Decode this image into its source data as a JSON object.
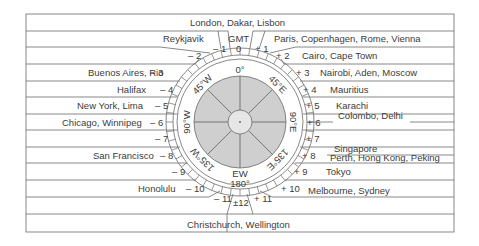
{
  "dial": {
    "gmt_label": "GMT",
    "bearing_labels": {
      "n": "0°",
      "ne": "45°E",
      "e": "90°E",
      "se": "135°E",
      "s": "180°",
      "sw": "135°W",
      "w": "90°W",
      "nw": "45°W",
      "dateline": "EW"
    }
  },
  "offsets": {
    "zero": "0",
    "m1": "– 1",
    "m2": "– 2",
    "m3": "– 3",
    "m4": "– 4",
    "m5": "– 5",
    "m6": "– 6",
    "m7": "– 7",
    "m8": "– 8",
    "m9": "– 9",
    "m10": "– 10",
    "m11": "– 11",
    "p1": "+ 1",
    "p2": "+ 2",
    "p3": "+ 3",
    "p4": "+ 4",
    "p5": "+ 5",
    "p6": "+ 6",
    "p7": "+ 7",
    "p8": "+ 8",
    "p9": "+ 9",
    "p10": "+ 10",
    "p11": "+ 11",
    "pm12": "±12"
  },
  "cities": {
    "gmt0": "London, Dakar, Lisbon",
    "m1": "Reykjavik",
    "m3": "Buenos Aires, Rio",
    "m4": "Halifax",
    "m5": "New York, Lima",
    "m6": "Chicago, Winnipeg",
    "m8": "San Francisco",
    "m10": "Honolulu",
    "pm12": "Christchurch, Wellington",
    "p1": "Paris, Copenhagen, Rome, Vienna",
    "p2": "Cairo, Cape Town",
    "p3": "Nairobi, Aden, Moscow",
    "p4": "Mauritius",
    "p5": "Karachi",
    "p5_5": "Colombo, Delhi",
    "p7_5": "Singapore",
    "p8": "Perth, Hong Kong, Peking",
    "p9": "Tokyo",
    "p10": "Melbourne, Sydney"
  },
  "colors": {
    "line": "#6a6a6a",
    "dial_fill": "#cfcfcf",
    "text": "#3c3c3c"
  }
}
